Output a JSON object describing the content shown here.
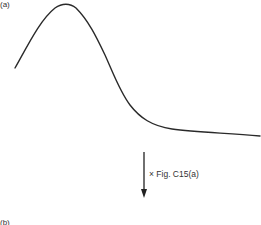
{
  "figure": {
    "panel_a_label": "(a)",
    "panel_b_label": "(b)",
    "operation_label": "× Fig. C15(a)",
    "colors": {
      "curve": "#2a2a2a",
      "arrow": "#222222",
      "background": "#ffffff"
    },
    "curve": {
      "description": "Skewed peak curve: rises from left to a maximum near the upper-left, falls steeply, then flattens to a near-constant tail on the right",
      "approx_points_px": [
        [
          15,
          68
        ],
        [
          35,
          30
        ],
        [
          63,
          5
        ],
        [
          80,
          15
        ],
        [
          100,
          40
        ],
        [
          125,
          100
        ],
        [
          150,
          123
        ],
        [
          170,
          130
        ],
        [
          210,
          133
        ],
        [
          260,
          136
        ]
      ]
    },
    "arrow": {
      "direction": "down",
      "x_px": 144,
      "y_start_px": 152,
      "y_end_px": 197
    }
  }
}
